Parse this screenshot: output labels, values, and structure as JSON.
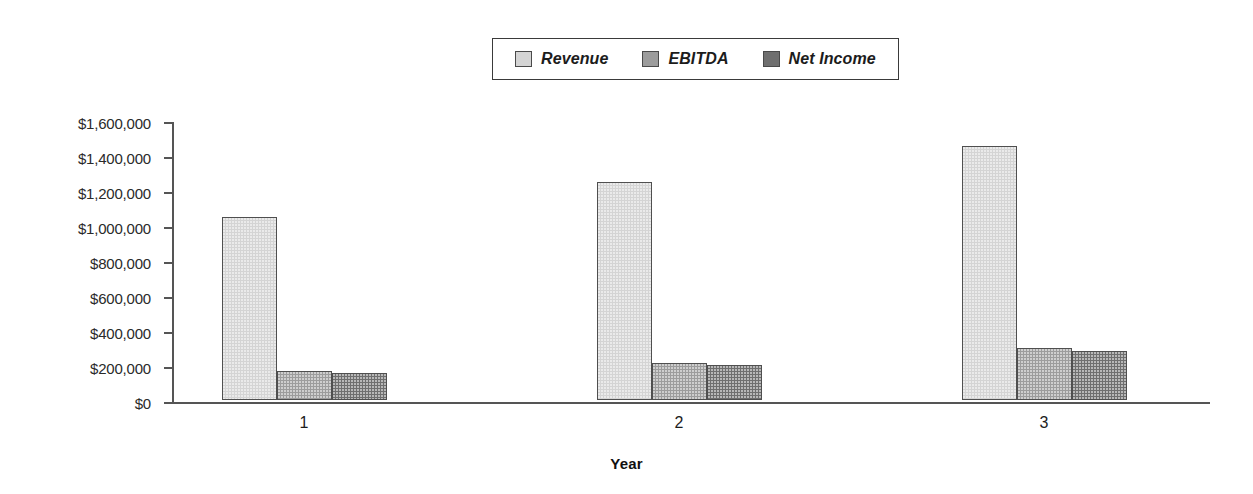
{
  "chart_data": {
    "type": "bar",
    "title": "",
    "subtitle": "",
    "xlabel": "Year",
    "ylabel": "",
    "categories": [
      "1",
      "2",
      "3"
    ],
    "series": [
      {
        "name": "Revenue",
        "color": "#d4d4d4",
        "values": [
          1045000,
          1245000,
          1450000
        ]
      },
      {
        "name": "EBITDA",
        "color": "#9c9c9c",
        "values": [
          165000,
          210000,
          295000
        ]
      },
      {
        "name": "Net Income",
        "color": "#6f6f6f",
        "values": [
          155000,
          200000,
          280000
        ]
      }
    ],
    "ylim": [
      0,
      1600000
    ],
    "ytick_values": [
      1600000,
      1400000,
      1200000,
      1000000,
      800000,
      600000,
      400000,
      200000,
      0
    ],
    "ytick_labels": [
      "$1,600,000",
      "$1,400,000",
      "$1,200,000",
      "$1,000,000",
      "$800,000",
      "$600,000",
      "$400,000",
      "$200,000",
      "$0"
    ],
    "grid": false,
    "legend_position": "top-center",
    "bar_grouping": "clustered"
  },
  "legend": {
    "entries": [
      {
        "label": "Revenue",
        "color": "#d4d4d4"
      },
      {
        "label": "EBITDA",
        "color": "#9c9c9c"
      },
      {
        "label": "Net Income",
        "color": "#6f6f6f"
      }
    ]
  },
  "axes": {
    "x_title": "Year"
  }
}
